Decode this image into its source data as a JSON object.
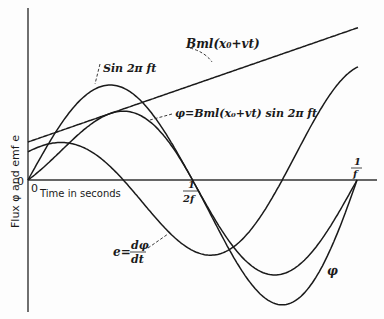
{
  "figure": {
    "y_axis_label": "Flux φ and emf e",
    "x_axis_label": "Time in seconds",
    "origin_y_label": "0",
    "origin_x_label": "0",
    "tick_half_period": {
      "num": "1",
      "den": "2f"
    },
    "tick_period": {
      "num": "1",
      "den": "f"
    },
    "labels": {
      "line": "Bml(x₀+vt)",
      "sine": "Sin 2π ft",
      "phi": "φ=Bml(x₀+vt) sin 2π ft",
      "emf_lhs": "e=",
      "emf_num": "dφ",
      "emf_den": "dt",
      "phi_short": "φ"
    },
    "colors": {
      "ink": "#1a1a1a",
      "background": "#fdfdfd"
    }
  },
  "chart_data": {
    "type": "line",
    "title": "",
    "xlabel": "Time in seconds",
    "ylabel": "Flux φ and emf e",
    "x_ticks": [
      "0",
      "1/2f",
      "1/f"
    ],
    "x_range": [
      0,
      1.06
    ],
    "x_unit": "fraction of period 1/f",
    "grid": false,
    "series": [
      {
        "name": "Bml(x₀+vt)",
        "kind": "straight line",
        "x": [
          0,
          1.0
        ],
        "y": [
          0.4,
          1.6
        ]
      },
      {
        "name": "Sin 2π ft",
        "kind": "sinusoid",
        "amplitude": 1.0,
        "x": [
          0,
          0.25,
          0.5,
          0.75,
          1.0
        ],
        "y": [
          0,
          1.0,
          0,
          -1.0,
          0
        ]
      },
      {
        "name": "φ=Bml(x₀+vt) sin 2π ft",
        "kind": "product",
        "x": [
          0,
          0.3,
          0.5,
          0.78,
          1.0
        ],
        "y": [
          0,
          0.74,
          0,
          -1.29,
          0
        ]
      },
      {
        "name": "e=dφ/dt",
        "kind": "derivative",
        "x": [
          0,
          0.12,
          0.5,
          0.56,
          1.0
        ],
        "y": [
          0.29,
          0.4,
          -0.55,
          -0.77,
          1.21
        ]
      }
    ]
  }
}
